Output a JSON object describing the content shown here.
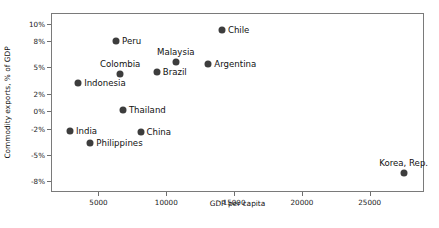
{
  "chart_data": {
    "type": "scatter",
    "title": "",
    "xlabel": "GDP per capita",
    "ylabel": "Commodity exports, % of GDP",
    "xlim": [
      1500,
      29000
    ],
    "ylim": [
      -9.2,
      11.2
    ],
    "grid": false,
    "legend": "none",
    "xticks": [
      {
        "value": 5000,
        "label": "5000"
      },
      {
        "value": 10000,
        "label": "10000"
      },
      {
        "value": 15000,
        "label": "15000"
      },
      {
        "value": 20000,
        "label": "20000"
      },
      {
        "value": 25000,
        "label": "25000"
      }
    ],
    "yticks": [
      {
        "value": 10,
        "label": "10%"
      },
      {
        "value": 8,
        "label": "8%"
      },
      {
        "value": 5,
        "label": "5%"
      },
      {
        "value": 2,
        "label": "2%"
      },
      {
        "value": 0,
        "label": "0%"
      },
      {
        "value": -2,
        "label": "-2%"
      },
      {
        "value": -5,
        "label": "-5%"
      },
      {
        "value": -8,
        "label": "-8%"
      }
    ],
    "points": [
      {
        "name": "Chile",
        "x": 14100,
        "y": 9.3,
        "label_pos": "right"
      },
      {
        "name": "Peru",
        "x": 6300,
        "y": 8.0,
        "label_pos": "right"
      },
      {
        "name": "Malaysia",
        "x": 10700,
        "y": 5.6,
        "label_pos": "above"
      },
      {
        "name": "Argentina",
        "x": 13100,
        "y": 5.4,
        "label_pos": "right"
      },
      {
        "name": "Colombia",
        "x": 6600,
        "y": 4.2,
        "label_pos": "above"
      },
      {
        "name": "Brazil",
        "x": 9300,
        "y": 4.5,
        "label_pos": "right"
      },
      {
        "name": "Indonesia",
        "x": 3500,
        "y": 3.2,
        "label_pos": "right"
      },
      {
        "name": "Thailand",
        "x": 6800,
        "y": 0.2,
        "label_pos": "right"
      },
      {
        "name": "India",
        "x": 2900,
        "y": -2.3,
        "label_pos": "right"
      },
      {
        "name": "Philippines",
        "x": 4400,
        "y": -3.6,
        "label_pos": "right"
      },
      {
        "name": "China",
        "x": 8100,
        "y": -2.4,
        "label_pos": "right"
      },
      {
        "name": "Korea, Rep.",
        "x": 27500,
        "y": -7.0,
        "label_pos": "above"
      }
    ],
    "colors": {
      "marker": "#3d3d3d",
      "frame": "#7a7a7a",
      "text": "#111111",
      "background": "#ffffff"
    }
  }
}
